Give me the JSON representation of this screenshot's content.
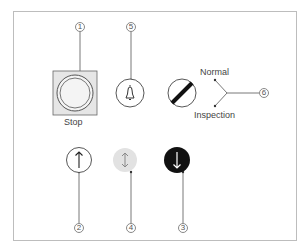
{
  "diagram": {
    "components": [
      {
        "id": 1,
        "callout": "1",
        "type": "stop-button",
        "label": "Stop"
      },
      {
        "id": 5,
        "callout": "5",
        "type": "alarm-bell-button",
        "label": ""
      },
      {
        "id": 6,
        "callout": "6",
        "type": "mode-selector-switch",
        "positions": [
          "Normal",
          "Inspection"
        ]
      },
      {
        "id": 2,
        "callout": "2",
        "type": "up-arrow-button",
        "label": ""
      },
      {
        "id": 4,
        "callout": "4",
        "type": "up-down-arrow-indicator",
        "label": ""
      },
      {
        "id": 3,
        "callout": "3",
        "type": "down-arrow-button",
        "label": ""
      }
    ],
    "labels": {
      "stop": "Stop",
      "normal": "Normal",
      "inspection": "Inspection"
    },
    "callouts": {
      "c1": "1",
      "c2": "2",
      "c3": "3",
      "c4": "4",
      "c5": "5",
      "c6": "6"
    },
    "colors": {
      "frame": "#bdbdbd",
      "stop_bg": "#e6e6e6",
      "line": "#555555",
      "down_btn": "#111111",
      "updown_bg": "#e2e2e2"
    }
  }
}
